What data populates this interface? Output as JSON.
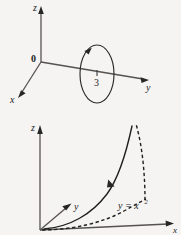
{
  "figure": {
    "background_color": "#f5f4f2",
    "ink_color": "#202020",
    "axis_color": "#55524f"
  },
  "top_diagram": {
    "name": "circle-radius-3-in-xy-plane",
    "axes": {
      "z_label": "z",
      "y_label": "y",
      "x_label": "x",
      "origin_label": "0"
    },
    "annotations": {
      "radius_label": "3"
    },
    "curve": {
      "type": "ellipse",
      "orientation": "counterclockwise",
      "center_axis": "y",
      "radius": 3
    }
  },
  "bottom_diagram": {
    "name": "parabola-cylinder-curve",
    "axes": {
      "z_label": "z",
      "y_label": "y",
      "x_label": "x"
    },
    "annotations": {
      "curve_equation": "y = x",
      "curve_equation_exponent": "2"
    },
    "curves": [
      {
        "name": "space-curve-solid",
        "style": "solid",
        "has_direction_arrow": true
      },
      {
        "name": "projection-parabola-dashed",
        "style": "dashed",
        "has_direction_arrow": false
      },
      {
        "name": "vertical-connector-dashed",
        "style": "dashed",
        "has_direction_arrow": false
      }
    ]
  }
}
